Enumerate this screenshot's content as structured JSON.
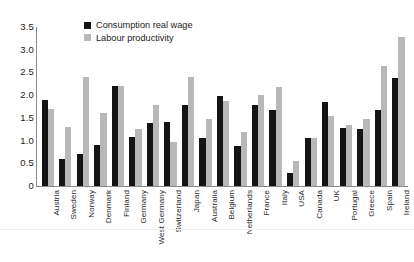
{
  "figure": {
    "top_text_remnant": "",
    "background_color": "#ffffff"
  },
  "legend": {
    "position": "top-left-inside",
    "entries": [
      {
        "label": "Consumption real wage",
        "color": "#141414",
        "key": "wage"
      },
      {
        "label": "Labour productivity",
        "color": "#b8b8b8",
        "key": "prod"
      }
    ]
  },
  "axes": {
    "y_ticks": [
      "3.5",
      "3.0",
      "2.5",
      "2.0",
      "1.5",
      "1.0",
      "0.5",
      "0"
    ],
    "y_min": 0,
    "y_max": 3.5,
    "grid": "none",
    "x_label": "",
    "y_label": ""
  },
  "chart_data": {
    "type": "bar",
    "title": "",
    "subtitle": "",
    "xlabel": "",
    "ylabel": "",
    "ylim": [
      0,
      3.5
    ],
    "ytick_step": 0.5,
    "grid": false,
    "legend_position": "upper left",
    "categories": [
      "Austria",
      "Sweden",
      "Norway",
      "Denmark",
      "Finland",
      "Germany",
      "West Germany",
      "Switzerland",
      "Japan",
      "Australia",
      "Belgium",
      "Netherlands",
      "France",
      "Italy",
      "USA",
      "Canada",
      "UK",
      "Portugal",
      "Greece",
      "Spain",
      "Ireland"
    ],
    "series": [
      {
        "name": "Consumption real wage",
        "color": "#141414",
        "values": [
          1.9,
          0.6,
          0.7,
          0.9,
          2.2,
          1.08,
          1.38,
          1.4,
          1.78,
          1.06,
          1.99,
          0.87,
          1.79,
          1.68,
          0.29,
          1.06,
          1.85,
          1.27,
          1.26,
          1.67,
          2.38
        ]
      },
      {
        "name": "Labour productivity",
        "color": "#b8b8b8",
        "values": [
          1.7,
          1.3,
          2.4,
          1.6,
          2.2,
          1.26,
          1.79,
          0.97,
          2.4,
          1.48,
          1.87,
          1.18,
          2.0,
          2.18,
          0.55,
          1.06,
          1.55,
          1.35,
          1.48,
          2.65,
          3.27
        ]
      }
    ]
  }
}
